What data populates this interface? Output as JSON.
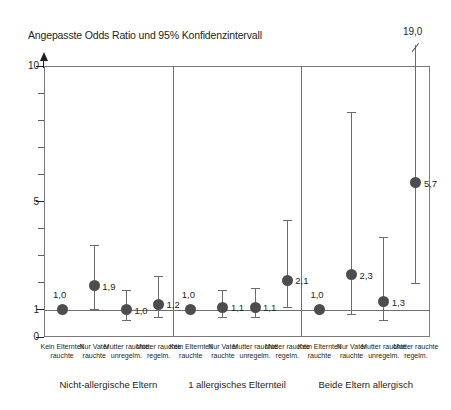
{
  "chart_data": {
    "type": "scatter",
    "title": "Angepasste Odds Ratio und 95% Konfidenzintervall",
    "xlabel": "",
    "ylabel": "",
    "ylim": [
      0,
      10
    ],
    "yticks_major": [
      "0",
      "1",
      "5",
      "10"
    ],
    "grid": false,
    "legend": "none",
    "reference_line": 1,
    "offscale_note": "19,0",
    "groups": [
      {
        "name": "Nicht-allergische Eltern",
        "categories": [
          "Kein Elternteil rauchte",
          "Nur Vater rauchte",
          "Mutter rauchte unregelm.",
          "Mutter rauchte regelm."
        ],
        "values": [
          1.0,
          1.9,
          1.0,
          1.2
        ],
        "labels": [
          "1,0",
          "1,9",
          "1,0",
          "1,2"
        ],
        "ci_low": [
          1.0,
          1.05,
          0.62,
          0.72
        ],
        "ci_high": [
          1.0,
          3.4,
          1.75,
          2.25
        ]
      },
      {
        "name": "1 allergisches Elternteil",
        "categories": [
          "Kein Elternteil rauchte",
          "Nur Vater rauchte",
          "Mutter rauchte unregelm.",
          "Mutter rauchte regelm."
        ],
        "values": [
          1.0,
          1.1,
          1.1,
          2.1
        ],
        "labels": [
          "1,0",
          "1,1",
          "1,1",
          "2,1"
        ],
        "ci_low": [
          1.0,
          0.72,
          0.72,
          1.12
        ],
        "ci_high": [
          1.0,
          1.75,
          1.8,
          4.3
        ]
      },
      {
        "name": "Beide Eltern allergisch",
        "categories": [
          "Kein Elternteil rauchte",
          "Nur Vater rauchte",
          "Mutter rauchte unregelm.",
          "Mutter rauchte regelm."
        ],
        "values": [
          1.0,
          2.3,
          1.3,
          5.7
        ],
        "labels": [
          "1,0",
          "2,3",
          "1,3",
          "5,7"
        ],
        "ci_low": [
          1.0,
          0.85,
          0.62,
          2.0
        ],
        "ci_high": [
          1.0,
          8.3,
          3.7,
          19.0
        ]
      }
    ]
  },
  "axis": {
    "y_labels": {
      "v10": "10",
      "v5": "5",
      "v1": "1",
      "v0": "0"
    }
  },
  "annotations": {
    "offscale_value": "19,0"
  },
  "categories_flat": [
    "Kein Elternteil rauchte",
    "Nur Vater rauchte",
    "Mutter rauchte unregelm.",
    "Mutter rauchte regelm.",
    "Kein Elternteil rauchte",
    "Nur Vater rauchte",
    "Mutter rauchte unregelm.",
    "Mutter rauchte regelm.",
    "Kein Elternteil rauchte",
    "Nur Vater rauchte",
    "Mutter rauchte unregelm.",
    "Mutter rauchte regelm."
  ],
  "colors": {
    "point": "#4d4d4d",
    "line": "#6b6b6b",
    "frame": "#7b7b7b",
    "text": "#231f20"
  }
}
